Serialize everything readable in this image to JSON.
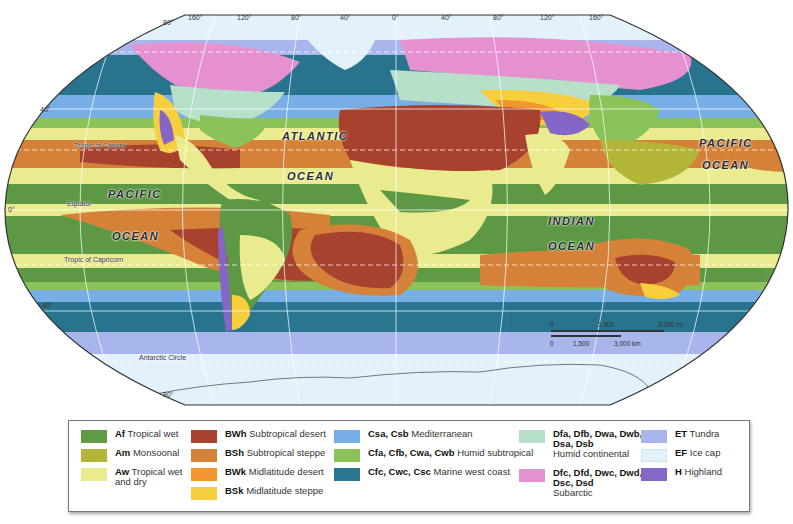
{
  "map": {
    "title": "World Climate Regions",
    "projection": "Robinson",
    "ocean_labels": [
      {
        "text": "ATLANTIC",
        "x": 282,
        "y": 128
      },
      {
        "text": "OCEAN",
        "x": 287,
        "y": 168
      },
      {
        "text": "PACIFIC",
        "x": 108,
        "y": 188
      },
      {
        "text": "OCEAN",
        "x": 112,
        "y": 230
      },
      {
        "text": "INDIAN",
        "x": 548,
        "y": 217
      },
      {
        "text": "OCEAN",
        "x": 548,
        "y": 242
      },
      {
        "text": "PACIFIC",
        "x": 699,
        "y": 138
      },
      {
        "text": "OCEAN",
        "x": 702,
        "y": 161
      }
    ],
    "line_labels": {
      "tropic_cancer": "Tropic of Cancer",
      "equator": "Equator",
      "tropic_capricorn": "Tropic of Capricorn",
      "antarctic_circle": "Antarctic Circle"
    },
    "longitude_labels": [
      "80°",
      "160°",
      "120°",
      "80°",
      "40°",
      "0°",
      "40°",
      "80°",
      "120°",
      "160°"
    ],
    "latitude_labels": {
      "lat40n": "40°",
      "lat0": "0°",
      "lat40s": "40°",
      "lat80s": "80°"
    },
    "scale_bar": {
      "miles": {
        "t0": "0",
        "t1": "1,500",
        "t2": "3,000 mi"
      },
      "km": {
        "t0": "0",
        "t1": "1,500",
        "t2": "3,000 km"
      }
    }
  },
  "legend": {
    "items": [
      {
        "code": "Af",
        "label": "Tropical wet",
        "color": "#5f9a45"
      },
      {
        "code": "Am",
        "label": "Monsoonal",
        "color": "#b3b53a"
      },
      {
        "code": "Aw",
        "label": "Tropical wet and dry",
        "color": "#eaeb8e"
      },
      {
        "code": "BWh",
        "label": "Subtropical desert",
        "color": "#a8432f"
      },
      {
        "code": "BSh",
        "label": "Subtropical steppe",
        "color": "#d6813a"
      },
      {
        "code": "BWk",
        "label": "Midlatitude desert",
        "color": "#f29630"
      },
      {
        "code": "BSk",
        "label": "Midlatitude steppe",
        "color": "#f7cf3d"
      },
      {
        "code": "Csa, Csb",
        "label": "Mediterranean",
        "color": "#78aee6"
      },
      {
        "code": "Cfa, Cfb, Cwa, Cwb",
        "label": "Humid subtropical",
        "color": "#8cc25a"
      },
      {
        "code": "Cfc, Cwc, Csc",
        "label": "Marine west coast",
        "color": "#2a7690"
      },
      {
        "code": "Dfa, Dfb, Dwa, Dwb, Dsa, Dsb",
        "label": "Humid continental",
        "color": "#b8dfc9"
      },
      {
        "code": "Dfc, Dfd, Dwc, Dwd, Dsc, Dsd",
        "label": "Subarctic",
        "color": "#e593cf"
      },
      {
        "code": "ET",
        "label": "Tundra",
        "color": "#a9b6ec"
      },
      {
        "code": "EF",
        "label": "Ice cap",
        "color": "#e3f2fa"
      },
      {
        "code": "H",
        "label": "Highland",
        "color": "#8567c7"
      }
    ]
  }
}
